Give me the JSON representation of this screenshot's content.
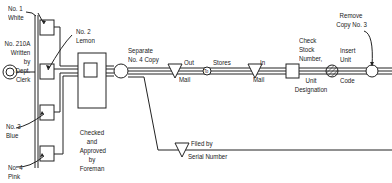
{
  "diagram": {
    "form_copies": [
      {
        "id": "copy-1",
        "label_line1": "No. 1",
        "label_line2": "White"
      },
      {
        "id": "copy-2",
        "label_line1": "No. 2",
        "label_line2": "Lemon"
      },
      {
        "id": "copy-3",
        "label_line1": "No. 3",
        "label_line2": "Blue"
      },
      {
        "id": "copy-4",
        "label_line1": "No. 4",
        "label_line2": "Pink"
      }
    ],
    "origin": {
      "line1": "No. 210A",
      "line2": "Written",
      "line3": "by",
      "line4": "Dept.",
      "line5": "Clerk"
    },
    "inspection": {
      "line1": "Checked",
      "line2": "and",
      "line3": "Approved",
      "line4": "by",
      "line5": "Foreman"
    },
    "steps": {
      "separate": {
        "line1": "Separate",
        "line2": "No. 4 Copy"
      },
      "out_mail": {
        "line1": "Out",
        "line2": "Mail"
      },
      "to_label": "To",
      "stores": "Stores",
      "in_mail": {
        "line1": "In",
        "line2": "Mail"
      },
      "check_stock": {
        "line1": "Check",
        "line2": "Stock",
        "line3": "Number,"
      },
      "unit_designation": {
        "line1": "Unit",
        "line2": "Designation"
      },
      "insert_unit": {
        "line1": "Insert",
        "line2": "Unit"
      },
      "code": "Code",
      "remove_copy": {
        "line1": "Remove",
        "line2": "Copy No. 3"
      },
      "filed": {
        "line1": "Filed by",
        "line2": "Serial Number"
      }
    },
    "symbols": {
      "operation": "circle",
      "inspection": "square",
      "storage": "inverted-triangle",
      "transport": "small-circle",
      "hatched_operation": "hatched-circle"
    },
    "colors": {
      "ink": "#222222",
      "background": "#ffffff"
    }
  }
}
